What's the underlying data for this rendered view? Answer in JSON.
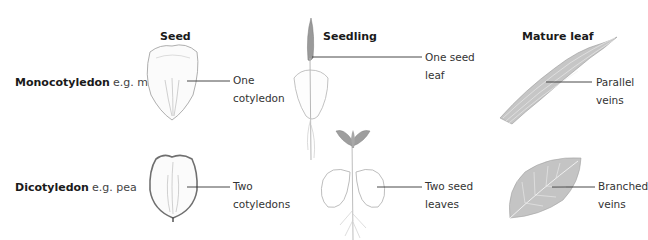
{
  "columns": {
    "seed": "Seed",
    "seedling": "Seedling",
    "mature_leaf": "Mature leaf"
  },
  "rows": {
    "monocot": {
      "name": "Monocotyledon",
      "example": "e.g. maize",
      "seed_label": "One\ncotyledon",
      "seedling_label": "One seed\nleaf",
      "leaf_label": "Parallel\nveins"
    },
    "dicot": {
      "name": "Dicotyledon",
      "example": "e.g. pea",
      "seed_label": "Two\ncotyledons",
      "seedling_label": "Two seed\nleaves",
      "leaf_label": "Branched\nveins"
    }
  },
  "colors": {
    "line": "#333333",
    "outline": "#8a8a8a",
    "leaf_fill": "#c9c9c9",
    "leaf_vein": "#f2f2f2"
  }
}
